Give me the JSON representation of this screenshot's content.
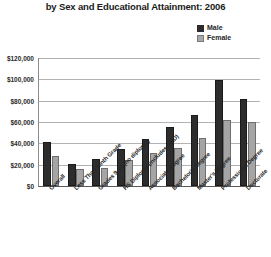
{
  "chart_data": {
    "type": "bar",
    "title": "by Sex and Educational Attainment: 2006",
    "xlabel": "",
    "ylabel": "",
    "ylim": [
      0,
      120000
    ],
    "ytick_labels": [
      "$120,000",
      "$100,000",
      "$80,000",
      "$60,000",
      "$40,000",
      "$20,000",
      "$0"
    ],
    "ytick_values": [
      120000,
      100000,
      80000,
      60000,
      40000,
      20000,
      0
    ],
    "grid": true,
    "legend_position": "top-right",
    "categories": [
      "Overall",
      "Less Than Ninth Grade",
      "Grades 9-12 (no diploma)",
      "HS Diploma (includes GED)",
      "Associate Degree",
      "Bachelor's Degree",
      "Master's Degree",
      "Professional Degree",
      "Doctorate"
    ],
    "series": [
      {
        "name": "Male",
        "color": "#2d2d2d",
        "values": [
          41000,
          21000,
          25000,
          35000,
          44000,
          55000,
          67000,
          99000,
          82000
        ]
      },
      {
        "name": "Female",
        "color": "#a5a5a5",
        "values": [
          28000,
          16000,
          17000,
          24000,
          31000,
          36000,
          45000,
          62000,
          60000
        ]
      }
    ]
  },
  "legend": {
    "items": [
      {
        "label": "Male",
        "swatch": "male-swatch"
      },
      {
        "label": "Female",
        "swatch": "female-swatch"
      }
    ]
  }
}
